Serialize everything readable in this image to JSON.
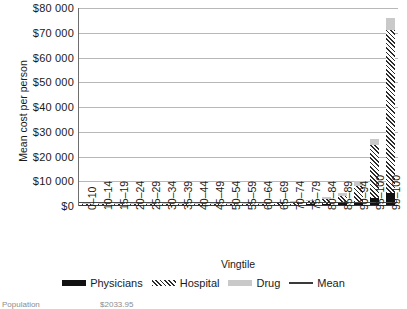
{
  "chart_data": {
    "type": "bar",
    "title": "",
    "xlabel": "Vingtile",
    "ylabel": "Mean cost per person",
    "ylim": [
      0,
      80000
    ],
    "ytick_labels": [
      "$80 000",
      "$70 000",
      "$60 000",
      "$50 000",
      "$40 000",
      "$30 000",
      "$20 000",
      "$10 000",
      "$0"
    ],
    "ytick_values": [
      80000,
      70000,
      60000,
      50000,
      40000,
      30000,
      20000,
      10000,
      0
    ],
    "grid": true,
    "stacked": true,
    "legend_position": "bottom",
    "categories": [
      "0–10",
      "10–14",
      "15–19",
      "20–24",
      "25–29",
      "30–34",
      "35–39",
      "40–44",
      "45–49",
      "50–54",
      "55–59",
      "60–64",
      "65–69",
      "70–74",
      "75–79",
      "80–84",
      "85–89",
      "90–94",
      "95–100",
      "99–100"
    ],
    "series": [
      {
        "name": "Physicians",
        "color": "#111111",
        "values": [
          120,
          70,
          70,
          90,
          110,
          120,
          140,
          170,
          200,
          240,
          300,
          360,
          430,
          520,
          640,
          800,
          1100,
          1700,
          3200,
          5200
        ]
      },
      {
        "name": "Hospital",
        "color": "#2b2b2b",
        "values": [
          180,
          90,
          90,
          120,
          150,
          170,
          200,
          250,
          310,
          380,
          480,
          600,
          760,
          980,
          1300,
          1900,
          3100,
          6200,
          21500,
          66000
        ]
      },
      {
        "name": "Drug",
        "color": "#c9c9c9",
        "values": [
          60,
          40,
          40,
          50,
          60,
          70,
          90,
          110,
          140,
          180,
          230,
          290,
          370,
          470,
          600,
          800,
          1200,
          2100,
          2300,
          4800
        ]
      }
    ],
    "mean_line": {
      "name": "Mean",
      "color": "#4a4a4a",
      "value": 1400
    }
  },
  "legend": {
    "items": [
      {
        "label": "Physicians",
        "swatch": "physicians-swatch"
      },
      {
        "label": "Hospital",
        "swatch": "hospital-swatch"
      },
      {
        "label": "Drug",
        "swatch": "drug-swatch"
      },
      {
        "label": "Mean",
        "swatch": "mean-swatch"
      }
    ]
  },
  "footnote": {
    "label": "Population",
    "value": "$2033.95"
  }
}
